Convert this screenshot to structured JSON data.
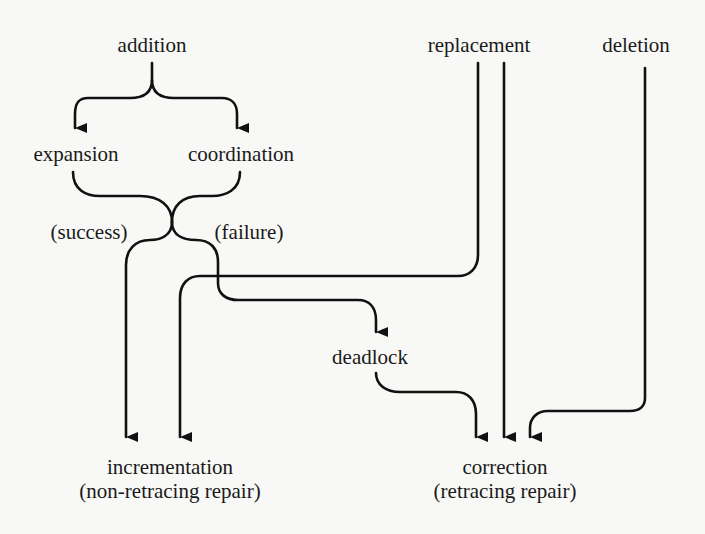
{
  "diagram": {
    "type": "flow",
    "nodes": {
      "addition": {
        "label": "addition"
      },
      "replacement": {
        "label": "replacement"
      },
      "deletion": {
        "label": "deletion"
      },
      "expansion": {
        "label": "expansion"
      },
      "coordination": {
        "label": "coordination"
      },
      "deadlock": {
        "label": "deadlock"
      },
      "incrementation": {
        "label": "incrementation",
        "sublabel": "(non-retracing repair)"
      },
      "correction": {
        "label": "correction",
        "sublabel": "(retracing repair)"
      }
    },
    "edge_labels": {
      "success": "(success)",
      "failure": "(failure)"
    },
    "edges": [
      {
        "from": "addition",
        "to": "expansion"
      },
      {
        "from": "addition",
        "to": "coordination"
      },
      {
        "from": "expansion/coordination",
        "to": "incrementation",
        "label": "(success)"
      },
      {
        "from": "expansion/coordination",
        "to": "deadlock",
        "label": "(failure)"
      },
      {
        "from": "replacement",
        "to": "incrementation"
      },
      {
        "from": "replacement",
        "to": "correction"
      },
      {
        "from": "deadlock",
        "to": "correction"
      },
      {
        "from": "deletion",
        "to": "correction"
      }
    ],
    "colors": {
      "line": "#111111",
      "background": "#f8f8f6",
      "text": "#1a1a1a"
    }
  }
}
